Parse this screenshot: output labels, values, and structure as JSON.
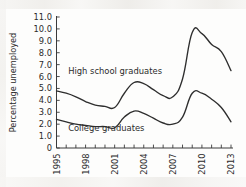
{
  "chart_data": {
    "type": "line",
    "title": "",
    "xlabel": "",
    "ylabel": "Percentage unemployed",
    "xlim": [
      1995,
      2013
    ],
    "ylim": [
      0,
      11
    ],
    "grid": false,
    "legend_position": "inline-annotation",
    "ytick_labels": [
      "11.0",
      "10.0",
      "9.0",
      "8.0",
      "7.0",
      "6.0",
      "5.0",
      "4.0",
      "3.0",
      "2.0",
      "1.0",
      "0"
    ],
    "ytick_values": [
      11,
      10,
      9,
      8,
      7,
      6,
      5,
      4,
      3,
      2,
      1,
      0
    ],
    "xtick_values": [
      1995,
      1996,
      1997,
      1998,
      1999,
      2000,
      2001,
      2002,
      2003,
      2004,
      2005,
      2006,
      2007,
      2008,
      2009,
      2010,
      2011,
      2012,
      2013
    ],
    "xtick_labels_shown": [
      "1995",
      "1998",
      "2001",
      "2004",
      "2007",
      "2010",
      "2013"
    ],
    "x": [
      1995,
      1996,
      1997,
      1998,
      1999,
      2000,
      2001,
      2002,
      2003,
      2004,
      2005,
      2006,
      2007,
      2008,
      2009,
      2010,
      2011,
      2012,
      2013
    ],
    "series": [
      {
        "name": "High school graduates",
        "color": "#2e2e2e",
        "values": [
          4.8,
          4.6,
          4.3,
          3.9,
          3.6,
          3.5,
          3.4,
          4.6,
          5.5,
          5.4,
          4.9,
          4.4,
          4.3,
          5.8,
          9.7,
          9.6,
          8.7,
          8.1,
          6.5
        ]
      },
      {
        "name": "College graduates",
        "color": "#2e2e2e",
        "values": [
          2.4,
          2.2,
          2.0,
          1.9,
          1.8,
          1.8,
          1.7,
          2.6,
          3.1,
          2.9,
          2.5,
          2.1,
          2.0,
          2.6,
          4.6,
          4.6,
          4.1,
          3.4,
          2.2
        ]
      }
    ],
    "annotations": [
      {
        "text": "High school graduates",
        "x": 1996.2,
        "y": 6.2
      },
      {
        "text": "College graduates",
        "x": 1996.2,
        "y": 1.45
      }
    ]
  }
}
